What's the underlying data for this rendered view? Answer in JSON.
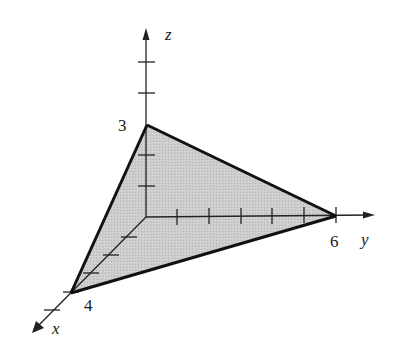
{
  "diagram": {
    "type": "3d-coordinate-plane-sketch",
    "axes": [
      {
        "name": "x",
        "label": "x",
        "intercept": 4,
        "intercept_label": "4",
        "ticks": 5
      },
      {
        "name": "y",
        "label": "y",
        "intercept": 6,
        "intercept_label": "6",
        "ticks": 6
      },
      {
        "name": "z",
        "label": "z",
        "intercept": 3,
        "intercept_label": "3",
        "ticks": 5
      }
    ],
    "vertices": [
      {
        "axis": "x",
        "point": [
          4,
          0,
          0
        ]
      },
      {
        "axis": "y",
        "point": [
          0,
          6,
          0
        ]
      },
      {
        "axis": "z",
        "point": [
          0,
          0,
          3
        ]
      }
    ],
    "colors": {
      "fill": "#c9c9c9",
      "edge": "#111111",
      "axis": "#222222",
      "background": "#ffffff"
    }
  },
  "labels": {
    "z_axis": "z",
    "y_axis": "y",
    "x_axis": "x",
    "z_intercept": "3",
    "y_intercept": "6",
    "x_intercept": "4"
  }
}
